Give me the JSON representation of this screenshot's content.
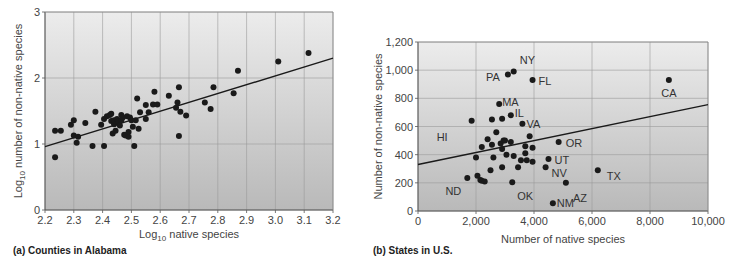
{
  "chart_data": [
    {
      "id": "a",
      "type": "scatter",
      "caption": "(a) Counties in Alabama",
      "xlabel_prefix": "Log",
      "xlabel_sub": "10",
      "xlabel_suffix": " native species",
      "ylabel": "Log10 number of non-native species",
      "ylabel_prefix": "Log",
      "ylabel_sub": "10",
      "ylabel_suffix": " number of non-native species",
      "xlim": [
        2.2,
        3.2
      ],
      "ylim": [
        0,
        3
      ],
      "xticks": [
        "2.2",
        "2.3",
        "2.4",
        "2.5",
        "2.6",
        "2.7",
        "2.8",
        "2.9",
        "3.0",
        "3.1",
        "3.2"
      ],
      "yticks": [
        "0",
        "1",
        "2",
        "3"
      ],
      "grid": true,
      "trendline": {
        "x": [
          2.2,
          3.2
        ],
        "y": [
          0.96,
          2.3
        ]
      },
      "points": [
        [
          2.235,
          0.8
        ],
        [
          2.235,
          1.2
        ],
        [
          2.255,
          1.2
        ],
        [
          2.29,
          1.29
        ],
        [
          2.3,
          1.36
        ],
        [
          2.3,
          1.13
        ],
        [
          2.31,
          1.02
        ],
        [
          2.315,
          1.11
        ],
        [
          2.34,
          1.32
        ],
        [
          2.365,
          0.97
        ],
        [
          2.375,
          1.49
        ],
        [
          2.395,
          1.29
        ],
        [
          2.405,
          1.38
        ],
        [
          2.405,
          0.97
        ],
        [
          2.415,
          1.42
        ],
        [
          2.425,
          1.44
        ],
        [
          2.43,
          1.46
        ],
        [
          2.43,
          1.35
        ],
        [
          2.435,
          1.16
        ],
        [
          2.44,
          1.3
        ],
        [
          2.44,
          1.36
        ],
        [
          2.445,
          1.2
        ],
        [
          2.45,
          1.33
        ],
        [
          2.45,
          1.38
        ],
        [
          2.455,
          1.34
        ],
        [
          2.46,
          1.28
        ],
        [
          2.465,
          1.44
        ],
        [
          2.465,
          1.36
        ],
        [
          2.47,
          1.4
        ],
        [
          2.475,
          1.14
        ],
        [
          2.48,
          1.13
        ],
        [
          2.485,
          1.42
        ],
        [
          2.49,
          1.11
        ],
        [
          2.49,
          1.18
        ],
        [
          2.495,
          1.4
        ],
        [
          2.5,
          1.36
        ],
        [
          2.505,
          1.26
        ],
        [
          2.51,
          0.97
        ],
        [
          2.515,
          1.36
        ],
        [
          2.52,
          1.69
        ],
        [
          2.525,
          1.23
        ],
        [
          2.53,
          1.48
        ],
        [
          2.55,
          1.38
        ],
        [
          2.55,
          1.59
        ],
        [
          2.56,
          1.48
        ],
        [
          2.575,
          1.6
        ],
        [
          2.58,
          1.79
        ],
        [
          2.59,
          1.6
        ],
        [
          2.63,
          1.73
        ],
        [
          2.655,
          1.55
        ],
        [
          2.66,
          1.63
        ],
        [
          2.665,
          1.86
        ],
        [
          2.665,
          1.12
        ],
        [
          2.67,
          1.49
        ],
        [
          2.69,
          1.43
        ],
        [
          2.755,
          1.63
        ],
        [
          2.775,
          1.53
        ],
        [
          2.785,
          1.86
        ],
        [
          2.855,
          1.77
        ],
        [
          2.87,
          2.11
        ],
        [
          3.01,
          2.25
        ],
        [
          3.115,
          2.38
        ]
      ]
    },
    {
      "id": "b",
      "type": "scatter",
      "caption": "(b) States in U.S.",
      "xlabel": "Number of native species",
      "ylabel": "Number of non-native species",
      "xlim": [
        0,
        10000
      ],
      "ylim": [
        0,
        1200
      ],
      "xticks": [
        "0",
        "2,000",
        "4,000",
        "6,000",
        "8,000",
        "10,000"
      ],
      "yticks": [
        "0",
        "200",
        "400",
        "600",
        "800",
        "1,000",
        "1,200"
      ],
      "grid": true,
      "trendline": {
        "x": [
          0,
          10000
        ],
        "y": [
          330,
          755
        ]
      },
      "labeled_points": [
        {
          "label": "NY",
          "x": 3300,
          "y": 990
        },
        {
          "label": "PA",
          "x": 3100,
          "y": 970
        },
        {
          "label": "FL",
          "x": 3950,
          "y": 930
        },
        {
          "label": "CA",
          "x": 8650,
          "y": 930
        },
        {
          "label": "MA",
          "x": 2800,
          "y": 760
        },
        {
          "label": "IL",
          "x": 3200,
          "y": 680
        },
        {
          "label": "HI",
          "x": 1850,
          "y": 640
        },
        {
          "label": "VA",
          "x": 3600,
          "y": 620
        },
        {
          "label": "OR",
          "x": 4850,
          "y": 490
        },
        {
          "label": "UT",
          "x": 4500,
          "y": 370
        },
        {
          "label": "NV",
          "x": 4400,
          "y": 310
        },
        {
          "label": "TX",
          "x": 6200,
          "y": 290
        },
        {
          "label": "ND",
          "x": 1700,
          "y": 235
        },
        {
          "label": "OK",
          "x": 3250,
          "y": 205
        },
        {
          "label": "AZ",
          "x": 5100,
          "y": 200
        },
        {
          "label": "NM",
          "x": 4650,
          "y": 55
        }
      ],
      "points": [
        [
          2550,
          650
        ],
        [
          2900,
          655
        ],
        [
          2700,
          560
        ],
        [
          2400,
          510
        ],
        [
          2200,
          455
        ],
        [
          2550,
          470
        ],
        [
          2850,
          480
        ],
        [
          2950,
          500
        ],
        [
          3200,
          490
        ],
        [
          3000,
          500
        ],
        [
          2900,
          440
        ],
        [
          3050,
          400
        ],
        [
          3300,
          390
        ],
        [
          2000,
          380
        ],
        [
          2600,
          380
        ],
        [
          3700,
          460
        ],
        [
          3850,
          530
        ],
        [
          3950,
          450
        ],
        [
          3700,
          410
        ],
        [
          3550,
          360
        ],
        [
          3750,
          360
        ],
        [
          3950,
          350
        ],
        [
          3450,
          310
        ],
        [
          2900,
          310
        ],
        [
          2500,
          290
        ],
        [
          2050,
          250
        ],
        [
          2150,
          220
        ],
        [
          2200,
          215
        ],
        [
          2300,
          210
        ]
      ]
    }
  ]
}
